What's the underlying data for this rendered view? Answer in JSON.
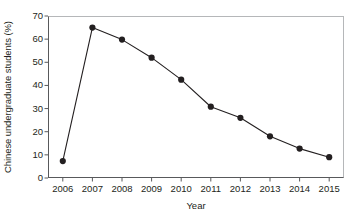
{
  "chart_data": {
    "type": "line",
    "title": "",
    "xlabel": "Year",
    "ylabel": "Chinese undergraduate students (%)",
    "categories": [
      "2006",
      "2007",
      "2008",
      "2009",
      "2010",
      "2011",
      "2012",
      "2013",
      "2014",
      "2015"
    ],
    "values": [
      7.3,
      65.0,
      59.8,
      52.0,
      42.5,
      30.8,
      26.0,
      18.0,
      12.7,
      9.0
    ],
    "series": [
      {
        "name": "Chinese undergraduate students",
        "values": [
          7.3,
          65.0,
          59.8,
          52.0,
          42.5,
          30.8,
          26.0,
          18.0,
          12.7,
          9.0
        ]
      }
    ],
    "ylim": [
      0,
      70
    ],
    "yticks": [
      0,
      10,
      20,
      30,
      40,
      50,
      60,
      70
    ],
    "ytick_labels": [
      "0",
      "10",
      "20",
      "30",
      "40",
      "50",
      "60",
      "70"
    ],
    "xtick_labels": [
      "2006",
      "2007",
      "2008",
      "2009",
      "2010",
      "2011",
      "2012",
      "2013",
      "2014",
      "2015"
    ],
    "grid": false,
    "legend": "none",
    "marker": "filled-circle",
    "line_color": "#231f20",
    "marker_color": "#231f20",
    "frame_color": "#b5b7b9",
    "axis_color": "#58595b",
    "background": "#ffffff"
  }
}
